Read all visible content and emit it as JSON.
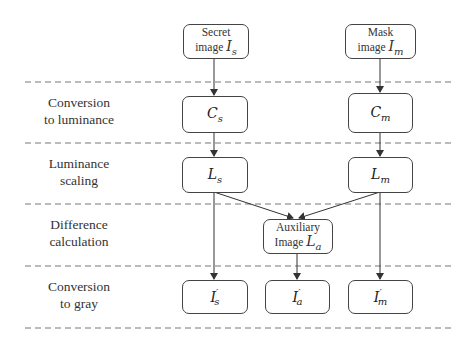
{
  "diagram": {
    "type": "flowchart",
    "stages": [
      {
        "id": "conversion-to-luminance",
        "line1": "Conversion",
        "line2": "to luminance"
      },
      {
        "id": "luminance-scaling",
        "line1": "Luminance",
        "line2": "scaling"
      },
      {
        "id": "difference-calculation",
        "line1": "Difference",
        "line2": "calculation"
      },
      {
        "id": "conversion-to-gray",
        "line1": "Conversion",
        "line2": "to gray"
      }
    ],
    "inputs": {
      "secret": {
        "line1": "Secret",
        "line2": "image",
        "symbol": "I",
        "sub": "s"
      },
      "mask": {
        "line1": "Mask",
        "line2": "image",
        "symbol": "I",
        "sub": "m"
      }
    },
    "nodes": {
      "c_s": {
        "symbol": "C",
        "sub": "s"
      },
      "c_m": {
        "symbol": "C",
        "sub": "m"
      },
      "l_s": {
        "symbol": "L",
        "sub": "s"
      },
      "l_m": {
        "symbol": "L",
        "sub": "m"
      },
      "aux": {
        "line1": "Auxiliary",
        "line2": "Image",
        "symbol": "L",
        "sub": "a"
      },
      "i_s": {
        "symbol": "I",
        "prime": "′",
        "sub": "s"
      },
      "i_a": {
        "symbol": "I",
        "prime": "′",
        "sub": "a"
      },
      "i_m": {
        "symbol": "I",
        "prime": "′",
        "sub": "m"
      }
    },
    "edges": [
      [
        "secret",
        "c_s"
      ],
      [
        "mask",
        "c_m"
      ],
      [
        "c_s",
        "l_s"
      ],
      [
        "c_m",
        "l_m"
      ],
      [
        "l_s",
        "aux"
      ],
      [
        "l_m",
        "aux"
      ],
      [
        "l_s",
        "i_s"
      ],
      [
        "aux",
        "i_a"
      ],
      [
        "l_m",
        "i_m"
      ]
    ]
  }
}
